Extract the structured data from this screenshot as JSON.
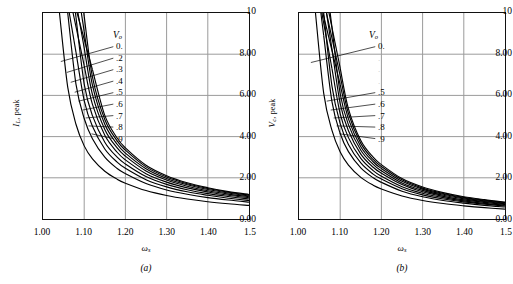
{
  "figure": {
    "panels": [
      {
        "id": "a",
        "caption": "(a)",
        "ylabel_main": "I",
        "ylabel_sub": "L",
        "ylabel_rest": ", peak",
        "xlabel_main": "ω",
        "xlabel_sub": "s",
        "legend_title_main": "V",
        "legend_title_sub": "o",
        "yticks": [
          "10",
          "8.00",
          "6.00",
          "4.00",
          "2.00",
          "0.00"
        ],
        "xticks": [
          "1.00",
          "1.10",
          "1.20",
          "1.30",
          "1.40",
          "1.5"
        ],
        "legend_values": [
          "0.",
          ".2",
          ".3",
          ".4",
          ".5",
          ".6",
          ".7",
          ".8",
          ".9"
        ],
        "legend_faint": [
          false,
          false,
          false,
          false,
          false,
          false,
          false,
          false,
          false
        ]
      },
      {
        "id": "b",
        "caption": "(b)",
        "ylabel_main": "V",
        "ylabel_sub": "c",
        "ylabel_rest": ", peak",
        "xlabel_main": "ω",
        "xlabel_sub": "s",
        "legend_title_main": "V",
        "legend_title_sub": "o",
        "yticks": [
          "10",
          "8.00",
          "6.00",
          "4.00",
          "2.00",
          "0.00"
        ],
        "xticks": [
          "1.00",
          "1.10",
          "1.20",
          "1.30",
          "1.40",
          "1.5"
        ],
        "legend_values": [
          "0.",
          ".",
          ".",
          ".",
          ".5",
          ".6",
          ".7",
          ".8",
          ".9"
        ],
        "legend_faint": [
          false,
          true,
          true,
          true,
          false,
          false,
          false,
          false,
          false
        ]
      }
    ]
  },
  "chart_data": [
    {
      "type": "line",
      "panel": "a",
      "title": "",
      "xlabel": "ωs",
      "ylabel": "IL, peak",
      "xlim": [
        1.0,
        1.5
      ],
      "ylim": [
        0.0,
        10.0
      ],
      "xticks": [
        1.0,
        1.1,
        1.2,
        1.3,
        1.4,
        1.5
      ],
      "yticks": [
        0.0,
        2.0,
        4.0,
        6.0,
        8.0,
        10.0
      ],
      "grid": true,
      "legend": "inline-leader-labels",
      "legend_title": "Vo",
      "x": [
        1.0,
        1.02,
        1.04,
        1.06,
        1.08,
        1.1,
        1.12,
        1.15,
        1.18,
        1.2,
        1.25,
        1.3,
        1.35,
        1.4,
        1.45,
        1.5
      ],
      "series": [
        {
          "name": "0.",
          "values": [
            null,
            null,
            10.0,
            6.4,
            4.6,
            3.55,
            2.92,
            2.32,
            1.93,
            1.74,
            1.38,
            1.14,
            0.97,
            0.84,
            0.74,
            0.66
          ]
        },
        {
          "name": ".2",
          "values": [
            null,
            null,
            null,
            10.0,
            6.55,
            4.88,
            3.9,
            3.0,
            2.45,
            2.2,
            1.72,
            1.41,
            1.2,
            1.04,
            0.92,
            0.82
          ]
        },
        {
          "name": ".3",
          "values": [
            null,
            null,
            null,
            null,
            8.1,
            5.75,
            4.5,
            3.4,
            2.76,
            2.46,
            1.91,
            1.56,
            1.32,
            1.15,
            1.01,
            0.9
          ]
        },
        {
          "name": ".4",
          "values": [
            null,
            null,
            null,
            null,
            9.8,
            6.55,
            5.02,
            3.73,
            3.0,
            2.67,
            2.06,
            1.68,
            1.42,
            1.23,
            1.09,
            0.97
          ]
        },
        {
          "name": ".5",
          "values": [
            null,
            null,
            null,
            null,
            null,
            7.45,
            5.56,
            4.06,
            3.24,
            2.87,
            2.2,
            1.79,
            1.51,
            1.31,
            1.15,
            1.03
          ]
        },
        {
          "name": ".6",
          "values": [
            null,
            null,
            null,
            null,
            null,
            8.3,
            6.05,
            4.35,
            3.45,
            3.05,
            2.33,
            1.89,
            1.59,
            1.37,
            1.21,
            1.08
          ]
        },
        {
          "name": ".7",
          "values": [
            null,
            null,
            null,
            null,
            null,
            9.1,
            6.5,
            4.6,
            3.63,
            3.2,
            2.44,
            1.97,
            1.66,
            1.43,
            1.26,
            1.12
          ]
        },
        {
          "name": ".8",
          "values": [
            null,
            null,
            null,
            null,
            null,
            9.85,
            6.9,
            4.83,
            3.79,
            3.34,
            2.53,
            2.04,
            1.71,
            1.48,
            1.3,
            1.16
          ]
        },
        {
          "name": ".9",
          "values": [
            null,
            null,
            null,
            null,
            null,
            null,
            7.25,
            5.03,
            3.93,
            3.45,
            2.61,
            2.1,
            1.76,
            1.52,
            1.33,
            1.19
          ]
        }
      ]
    },
    {
      "type": "line",
      "panel": "b",
      "title": "",
      "xlabel": "ωs",
      "ylabel": "Vc, peak",
      "xlim": [
        1.0,
        1.5
      ],
      "ylim": [
        0.0,
        10.0
      ],
      "xticks": [
        1.0,
        1.1,
        1.2,
        1.3,
        1.4,
        1.5
      ],
      "yticks": [
        0.0,
        2.0,
        4.0,
        6.0,
        8.0,
        10.0
      ],
      "grid": true,
      "legend": "inline-leader-labels",
      "legend_title": "Vo",
      "x": [
        1.0,
        1.02,
        1.04,
        1.06,
        1.08,
        1.1,
        1.12,
        1.15,
        1.18,
        1.2,
        1.25,
        1.3,
        1.35,
        1.4,
        1.45,
        1.5
      ],
      "series": [
        {
          "name": "0.",
          "values": [
            null,
            null,
            10.0,
            6.1,
            4.3,
            3.25,
            2.62,
            2.02,
            1.64,
            1.46,
            1.12,
            0.9,
            0.75,
            0.64,
            0.55,
            0.48
          ]
        },
        {
          "name": ".2",
          "values": [
            null,
            null,
            null,
            8.9,
            5.7,
            4.15,
            3.27,
            2.48,
            2.0,
            1.78,
            1.35,
            1.08,
            0.9,
            0.77,
            0.66,
            0.58
          ]
        },
        {
          "name": ".3",
          "values": [
            null,
            null,
            null,
            10.0,
            6.45,
            4.63,
            3.62,
            2.72,
            2.18,
            1.94,
            1.47,
            1.17,
            0.97,
            0.83,
            0.72,
            0.63
          ]
        },
        {
          "name": ".4",
          "values": [
            null,
            null,
            null,
            null,
            7.3,
            5.1,
            3.95,
            2.94,
            2.35,
            2.08,
            1.57,
            1.25,
            1.04,
            0.88,
            0.76,
            0.67
          ]
        },
        {
          "name": ".5",
          "values": [
            null,
            null,
            null,
            null,
            8.25,
            5.6,
            4.28,
            3.15,
            2.51,
            2.22,
            1.67,
            1.32,
            1.1,
            0.93,
            0.81,
            0.71
          ]
        },
        {
          "name": ".6",
          "values": [
            null,
            null,
            null,
            null,
            9.3,
            6.08,
            4.58,
            3.34,
            2.65,
            2.34,
            1.75,
            1.39,
            1.15,
            0.98,
            0.85,
            0.74
          ]
        },
        {
          "name": ".7",
          "values": [
            null,
            null,
            null,
            null,
            null,
            6.52,
            4.86,
            3.51,
            2.78,
            2.45,
            1.83,
            1.45,
            1.2,
            1.02,
            0.88,
            0.77
          ]
        },
        {
          "name": ".8",
          "values": [
            null,
            null,
            null,
            null,
            null,
            6.95,
            5.12,
            3.67,
            2.89,
            2.55,
            1.9,
            1.5,
            1.24,
            1.05,
            0.91,
            0.8
          ]
        },
        {
          "name": ".9",
          "values": [
            null,
            null,
            null,
            null,
            null,
            7.32,
            5.35,
            3.81,
            3.0,
            2.64,
            1.96,
            1.55,
            1.28,
            1.08,
            0.94,
            0.82
          ]
        }
      ]
    }
  ]
}
